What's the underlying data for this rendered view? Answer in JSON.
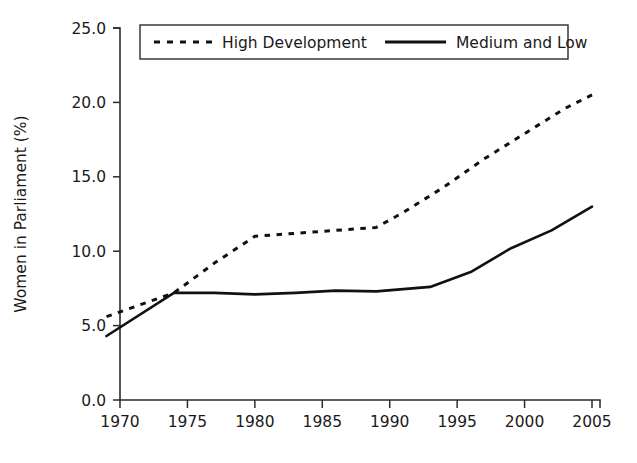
{
  "chart_data": {
    "type": "line",
    "title": "",
    "xlabel": "",
    "ylabel": "Women in Parliament (%)",
    "xlim": [
      1969,
      2005
    ],
    "ylim": [
      0.0,
      25.0
    ],
    "grid": false,
    "legend_position": "top",
    "x_ticks": [
      "1970",
      "1975",
      "1980",
      "1985",
      "1990",
      "1995",
      "2000",
      "2005"
    ],
    "x_tick_values": [
      1970,
      1975,
      1980,
      1985,
      1990,
      1995,
      2000,
      2005
    ],
    "y_ticks": [
      "0.0",
      "5.0",
      "10.0",
      "15.0",
      "20.0",
      "25.0"
    ],
    "y_tick_values": [
      0.0,
      5.0,
      10.0,
      15.0,
      20.0,
      25.0
    ],
    "series": [
      {
        "name": "High Development",
        "style": "dashed",
        "color": "#111111",
        "x": [
          1969,
          1974,
          1977,
          1980,
          1983,
          1986,
          1989,
          1991,
          1994,
          1997,
          2000,
          2003,
          2005
        ],
        "values": [
          5.6,
          7.2,
          9.2,
          11.0,
          11.2,
          11.4,
          11.6,
          12.6,
          14.3,
          16.2,
          17.9,
          19.6,
          20.5
        ]
      },
      {
        "name": "Medium and Low",
        "style": "solid",
        "color": "#111111",
        "x": [
          1969,
          1974,
          1977,
          1980,
          1983,
          1986,
          1989,
          1991,
          1993,
          1996,
          1999,
          2002,
          2005
        ],
        "values": [
          4.3,
          7.2,
          7.2,
          7.1,
          7.2,
          7.35,
          7.3,
          7.45,
          7.6,
          8.6,
          10.2,
          11.4,
          13.0
        ]
      }
    ]
  },
  "legend": {
    "items": [
      {
        "label": "High Development",
        "style": "dashed"
      },
      {
        "label": "Medium and Low",
        "style": "solid"
      }
    ]
  },
  "axes": {
    "y_title": "Women in Parliament (%)"
  }
}
